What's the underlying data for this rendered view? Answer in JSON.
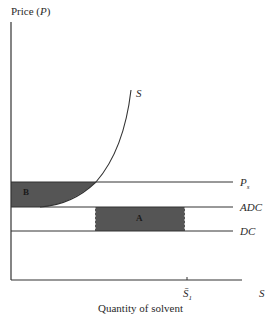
{
  "diagram": {
    "y_axis": {
      "label_text": "Price (",
      "label_var": "P",
      "label_close": ")"
    },
    "x_axis": {
      "label": "Quantity of solvent",
      "end_label": "S",
      "tick_label": "S̄",
      "tick_sub": "1"
    },
    "curves": {
      "supply": {
        "label": "S"
      }
    },
    "lines": {
      "ps": {
        "label": "P",
        "sub": "s"
      },
      "adc": {
        "label": "ADC"
      },
      "dc": {
        "label": "DC"
      }
    },
    "areas": {
      "a": {
        "label": "A",
        "fill": "#555555"
      },
      "b": {
        "label": "B",
        "fill": "#555555"
      }
    },
    "colors": {
      "line": "#333333",
      "fill": "#555555",
      "background": "#ffffff"
    }
  }
}
